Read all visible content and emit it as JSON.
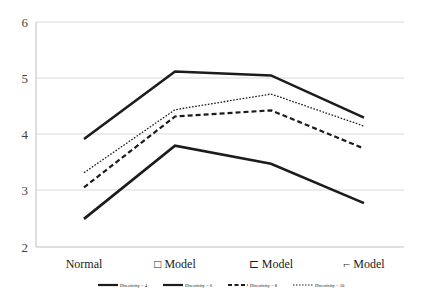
{
  "chart_data": {
    "type": "line",
    "title": "",
    "subtitle": "",
    "xlabel": "",
    "ylabel": "",
    "categories": [
      "Normal",
      "□ Model",
      "⊏ Model",
      "⌐ Model"
    ],
    "ylim": [
      2,
      6
    ],
    "yticks": [
      2,
      3,
      4,
      5,
      6
    ],
    "ytick_labels": [
      "2",
      "3",
      "4",
      "5",
      "6"
    ],
    "grid": "horizontal",
    "legend_position": "bottom",
    "series": [
      {
        "name": "Directivity = 4",
        "style": "solid-thick",
        "values": [
          2.5,
          3.8,
          3.48,
          2.78
        ]
      },
      {
        "name": "Directivity = 6",
        "style": "solid-thick",
        "values": [
          3.92,
          5.12,
          5.05,
          4.3
        ]
      },
      {
        "name": "Directivity = 8",
        "style": "dashed",
        "values": [
          3.06,
          4.32,
          4.43,
          3.75
        ]
      },
      {
        "name": "Directivity = 10",
        "style": "dotted",
        "values": [
          3.32,
          4.44,
          4.72,
          4.15
        ]
      }
    ]
  },
  "axis": {
    "y_labels": [
      "6",
      "5",
      "4",
      "3",
      "2"
    ],
    "x_labels": [
      "Normal",
      "□ Model",
      "⊏ Model",
      "⌐ Model"
    ]
  },
  "legend": {
    "items": [
      {
        "label": "Directivity = 4"
      },
      {
        "label": "Directivity = 6"
      },
      {
        "label": "Directivity = 8"
      },
      {
        "label": "Directivity = 10"
      }
    ]
  },
  "colors": {
    "series": "#1c1c1c",
    "grid": "#d9d9d9",
    "axis": "#bfbfbf",
    "y_label": "#3f3f3f",
    "x_label": "#1a1a1a",
    "background": "#ffffff"
  }
}
